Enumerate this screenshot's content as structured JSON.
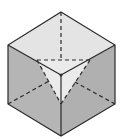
{
  "diagram": {
    "type": "cube-with-corner-section",
    "colors": {
      "background": "#ffffff",
      "top_face": "#e4e4e4",
      "side_faces": "#b5b5b5",
      "section_triangle": "#ebebeb",
      "edge": "#2a2a2a"
    },
    "vertices": {
      "top": [
        61,
        12
      ],
      "upper_left": [
        8,
        45
      ],
      "upper_right": [
        115,
        45
      ],
      "front": [
        61,
        75
      ],
      "lower_left": [
        8,
        104
      ],
      "lower_right": [
        115,
        104
      ],
      "bottom": [
        61,
        136
      ],
      "tri_left": [
        37,
        60
      ],
      "tri_right": [
        90,
        60
      ],
      "tri_bottom": [
        61,
        104
      ]
    }
  }
}
